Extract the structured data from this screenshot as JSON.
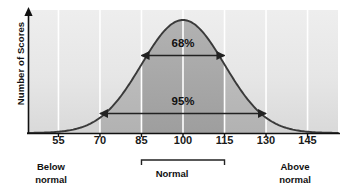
{
  "figure": {
    "title": "",
    "y_axis_label": "Number of Scores"
  },
  "chart_data": {
    "type": "line",
    "subtype": "normal-distribution-curve",
    "title": "",
    "xlabel": "",
    "ylabel": "Number of Scores",
    "xlim": [
      44,
      156
    ],
    "ylim": [
      0,
      1
    ],
    "grid": "vertical-white-gridlines",
    "legend": "none",
    "x_tick_labels": [
      "55",
      "70",
      "85",
      "100",
      "115",
      "130",
      "145"
    ],
    "x_tick_values": [
      55,
      70,
      85,
      100,
      115,
      130,
      145
    ],
    "y_tick_labels": [],
    "distribution": {
      "mean": 100,
      "std_dev": 15,
      "peak_x": 100
    },
    "annotations": [
      {
        "id": "pct68",
        "label": "68%",
        "from_x": 85,
        "to_x": 115,
        "arrow": "double"
      },
      {
        "id": "pct95",
        "label": "95%",
        "from_x": 70,
        "to_x": 130,
        "arrow": "double"
      }
    ],
    "shaded_bands": [
      {
        "from_x": 85,
        "to_x": 115,
        "shade": "dark",
        "color": "#a8a8a8"
      },
      {
        "from_x": 70,
        "to_x": 85,
        "shade": "medium",
        "color": "#bcbcbc"
      },
      {
        "from_x": 115,
        "to_x": 130,
        "shade": "medium",
        "color": "#bcbcbc"
      },
      {
        "from_x": 44,
        "to_x": 70,
        "shade": "light",
        "color": "#d2d2d2"
      },
      {
        "from_x": 130,
        "to_x": 156,
        "shade": "light",
        "color": "#d2d2d2"
      }
    ],
    "category_brackets": [
      {
        "label": "Normal",
        "from_x": 85,
        "to_x": 115
      }
    ]
  },
  "labels": {
    "pct_68": "68%",
    "pct_95": "95%",
    "below_normal_line1": "Below",
    "below_normal_line2": "normal",
    "normal": "Normal",
    "above_normal_line1": "Above",
    "above_normal_line2": "normal"
  },
  "colors": {
    "background": "#ffffff",
    "plot_fill_light": "#e2e2e2",
    "plot_fill_dark": "#a8a8a8",
    "curve": "#333333",
    "axis": "#111111",
    "gridline": "#ffffff",
    "text": "#111111"
  }
}
